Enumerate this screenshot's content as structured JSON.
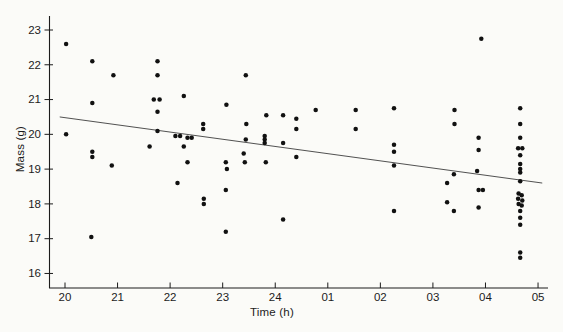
{
  "figure": {
    "background": "#fbfbf8",
    "ink": "#1c1c1c",
    "marker_color": "#111111",
    "line_color": "#3d3d3d"
  },
  "chart_data": {
    "type": "scatter",
    "title": "",
    "xlabel": "Time (h)",
    "ylabel": "Mass (g)",
    "grid": false,
    "legend": "none",
    "x_axis": {
      "tick_labels": [
        "20",
        "21",
        "22",
        "23",
        "24",
        "01",
        "02",
        "03",
        "04",
        "05"
      ],
      "tick_values": [
        20,
        21,
        22,
        23,
        24,
        25,
        26,
        27,
        28,
        29
      ],
      "note": "clock hours; values greater than 24 represent times after midnight (25=01h)",
      "range": [
        19.7,
        29.2
      ]
    },
    "y_axis": {
      "tick_labels": [
        "16",
        "17",
        "18",
        "19",
        "20",
        "21",
        "22",
        "23"
      ],
      "tick_values": [
        16,
        17,
        18,
        19,
        20,
        21,
        22,
        23
      ],
      "range": [
        15.7,
        23.45
      ]
    },
    "marker": {
      "shape": "circle",
      "radius_px": 2.25
    },
    "trend_line": {
      "x1": 19.9,
      "y1": 20.5,
      "x2": 29.08,
      "y2": 18.6
    },
    "points": [
      [
        20.02,
        22.6
      ],
      [
        20.02,
        20.0
      ],
      [
        20.52,
        22.1
      ],
      [
        20.52,
        20.9
      ],
      [
        20.52,
        19.5
      ],
      [
        20.52,
        19.35
      ],
      [
        20.5,
        17.05
      ],
      [
        20.92,
        21.7
      ],
      [
        20.89,
        19.1
      ],
      [
        21.76,
        22.1
      ],
      [
        21.76,
        21.7
      ],
      [
        21.69,
        21.0
      ],
      [
        21.8,
        21.0
      ],
      [
        21.76,
        20.65
      ],
      [
        21.76,
        20.1
      ],
      [
        21.61,
        19.65
      ],
      [
        22.1,
        19.95
      ],
      [
        22.19,
        19.95
      ],
      [
        22.33,
        19.9
      ],
      [
        22.41,
        19.9
      ],
      [
        22.26,
        21.1
      ],
      [
        22.63,
        20.3
      ],
      [
        22.63,
        20.15
      ],
      [
        22.26,
        19.65
      ],
      [
        22.33,
        19.2
      ],
      [
        22.14,
        18.6
      ],
      [
        22.64,
        18.15
      ],
      [
        22.64,
        18.0
      ],
      [
        23.44,
        21.7
      ],
      [
        23.07,
        20.85
      ],
      [
        23.45,
        20.3
      ],
      [
        23.83,
        20.55
      ],
      [
        24.15,
        20.55
      ],
      [
        24.4,
        20.45
      ],
      [
        24.4,
        20.15
      ],
      [
        24.77,
        20.7
      ],
      [
        25.53,
        20.7
      ],
      [
        25.53,
        20.15
      ],
      [
        23.44,
        19.85
      ],
      [
        23.8,
        19.95
      ],
      [
        23.8,
        19.85
      ],
      [
        23.8,
        19.75
      ],
      [
        24.15,
        19.75
      ],
      [
        23.4,
        19.45
      ],
      [
        23.06,
        19.2
      ],
      [
        23.08,
        19.0
      ],
      [
        23.42,
        19.2
      ],
      [
        23.82,
        19.2
      ],
      [
        24.4,
        19.35
      ],
      [
        23.06,
        18.4
      ],
      [
        24.15,
        17.55
      ],
      [
        23.06,
        17.2
      ],
      [
        27.92,
        22.75
      ],
      [
        26.26,
        20.75
      ],
      [
        26.26,
        19.7
      ],
      [
        26.26,
        19.5
      ],
      [
        26.26,
        19.1
      ],
      [
        26.26,
        17.8
      ],
      [
        27.41,
        20.7
      ],
      [
        27.41,
        20.3
      ],
      [
        27.4,
        18.85
      ],
      [
        27.27,
        18.6
      ],
      [
        27.27,
        18.05
      ],
      [
        27.4,
        17.8
      ],
      [
        27.87,
        19.9
      ],
      [
        27.87,
        19.55
      ],
      [
        27.84,
        18.95
      ],
      [
        27.87,
        18.4
      ],
      [
        27.95,
        18.4
      ],
      [
        27.87,
        17.9
      ],
      [
        28.66,
        20.75
      ],
      [
        28.66,
        20.3
      ],
      [
        28.66,
        19.9
      ],
      [
        28.62,
        19.6
      ],
      [
        28.7,
        19.6
      ],
      [
        28.66,
        19.4
      ],
      [
        28.66,
        19.15
      ],
      [
        28.66,
        19.0
      ],
      [
        28.66,
        18.9
      ],
      [
        28.66,
        18.65
      ],
      [
        28.63,
        18.3
      ],
      [
        28.69,
        18.25
      ],
      [
        28.62,
        18.15
      ],
      [
        28.7,
        18.1
      ],
      [
        28.63,
        18.0
      ],
      [
        28.69,
        17.95
      ],
      [
        28.66,
        17.8
      ],
      [
        28.66,
        17.6
      ],
      [
        28.66,
        17.4
      ],
      [
        28.66,
        16.6
      ],
      [
        28.66,
        16.45
      ]
    ]
  }
}
